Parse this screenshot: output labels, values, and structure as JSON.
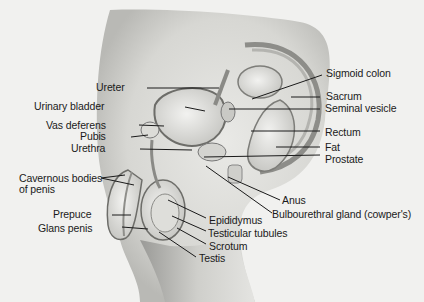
{
  "diagram": {
    "type": "anatomical-cross-section",
    "labels_left": [
      {
        "id": "ureter",
        "text": "Ureter",
        "x": 118,
        "y": 88
      },
      {
        "id": "urinary-bladder",
        "text": "Urinary bladder",
        "x": 105,
        "y": 107
      },
      {
        "id": "vas-deferens",
        "text": "Vas deferens",
        "x": 103,
        "y": 126
      },
      {
        "id": "pubis",
        "text": "Pubis",
        "x": 103,
        "y": 137
      },
      {
        "id": "urethra",
        "text": "Urethra",
        "x": 102,
        "y": 149
      },
      {
        "id": "cavernous-bodies",
        "text": "Cavernous bodies",
        "x": 18,
        "y": 175
      },
      {
        "id": "cavernous-bodies-2",
        "text": "of penis",
        "x": 18,
        "y": 187
      },
      {
        "id": "prepuce",
        "text": "Prepuce",
        "x": 90,
        "y": 215
      },
      {
        "id": "glans-penis",
        "text": "Glans penis",
        "x": 90,
        "y": 229
      }
    ],
    "labels_right": [
      {
        "id": "sigmoid-colon",
        "text": "Sigmoid colon",
        "x": 326,
        "y": 70
      },
      {
        "id": "sacrum",
        "text": "Sacrum",
        "x": 326,
        "y": 93
      },
      {
        "id": "seminal-vesicle",
        "text": "Seminal vesicle",
        "x": 324,
        "y": 106
      },
      {
        "id": "rectum",
        "text": "Rectum",
        "x": 324,
        "y": 129
      },
      {
        "id": "fat",
        "text": "Fat",
        "x": 324,
        "y": 145
      },
      {
        "id": "prostate",
        "text": "Prostate",
        "x": 324,
        "y": 157
      },
      {
        "id": "anus",
        "text": "Anus",
        "x": 282,
        "y": 197
      },
      {
        "id": "bulbourethral-gland",
        "text": "Bulbourethral gland (cowper's)",
        "x": 274,
        "y": 210
      },
      {
        "id": "epididymus",
        "text": "Epididymus",
        "x": 209,
        "y": 215
      },
      {
        "id": "testicular-tubules",
        "text": "Testicular tubules",
        "x": 209,
        "y": 228
      },
      {
        "id": "scrotum",
        "text": "Scrotum",
        "x": 209,
        "y": 241
      },
      {
        "id": "testis",
        "text": "Testis",
        "x": 199,
        "y": 254
      }
    ]
  }
}
